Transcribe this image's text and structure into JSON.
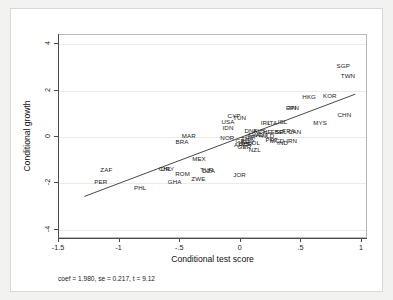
{
  "chart_data": {
    "type": "scatter",
    "title": "",
    "xlabel": "Conditional test score",
    "ylabel": "Conditional growth",
    "xlim": [
      -1.5,
      1.05
    ],
    "ylim": [
      -4.4,
      4.4
    ],
    "xticks": [
      -1.5,
      -1,
      -0.5,
      0,
      0.5,
      1
    ],
    "xticklabels": [
      "-1.5",
      "-1",
      "-.5",
      "0",
      ".5",
      "1"
    ],
    "yticks": [
      4,
      2,
      0,
      -2,
      -4
    ],
    "yticklabels": [
      "4",
      "2",
      "0",
      "-2",
      "-4"
    ],
    "grid": "horizontal",
    "marker_style": "text-label",
    "legend": "none",
    "annotation": "coef = 1.980, se = 0.217, t = 9.12",
    "fit_line": {
      "type": "linear",
      "slope": 1.98,
      "intercept": -0.08,
      "x_start": -1.29,
      "x_end": 0.96,
      "color": "#333333"
    },
    "points": [
      {
        "label": "SGP",
        "x": 0.845,
        "y": 3.06
      },
      {
        "label": "TWN",
        "x": 0.885,
        "y": 2.62
      },
      {
        "label": "HKG",
        "x": 0.565,
        "y": 1.74
      },
      {
        "label": "KOR",
        "x": 0.735,
        "y": 1.76
      },
      {
        "label": "CHN",
        "x": 0.855,
        "y": 0.93
      },
      {
        "label": "MYS",
        "x": 0.655,
        "y": 0.6
      },
      {
        "label": "FIN",
        "x": 0.415,
        "y": 1.26
      },
      {
        "label": "JPN",
        "x": 0.432,
        "y": 1.26
      },
      {
        "label": "ISL",
        "x": 0.345,
        "y": 0.63
      },
      {
        "label": "IRL",
        "x": 0.205,
        "y": 0.62
      },
      {
        "label": "ITA",
        "x": 0.262,
        "y": 0.61
      },
      {
        "label": "CYP",
        "x": -0.055,
        "y": 0.92
      },
      {
        "label": "TUN",
        "x": -0.01,
        "y": 0.82
      },
      {
        "label": "USA",
        "x": -0.105,
        "y": 0.64
      },
      {
        "label": "IDN",
        "x": -0.105,
        "y": 0.37
      },
      {
        "label": "NOR",
        "x": -0.11,
        "y": -0.04
      },
      {
        "label": "MAR",
        "x": -0.43,
        "y": 0.05
      },
      {
        "label": "BRA",
        "x": -0.485,
        "y": -0.2
      },
      {
        "label": "FRA",
        "x": 0.395,
        "y": 0.24
      },
      {
        "label": "CAN",
        "x": 0.445,
        "y": 0.22
      },
      {
        "label": "BEL",
        "x": 0.33,
        "y": 0.23
      },
      {
        "label": "ESP",
        "x": 0.3,
        "y": 0.23
      },
      {
        "label": "DNK",
        "x": 0.085,
        "y": 0.26
      },
      {
        "label": "AUS",
        "x": 0.155,
        "y": 0.25
      },
      {
        "label": "CHE",
        "x": 0.2,
        "y": 0.23
      },
      {
        "label": "SWE",
        "x": 0.12,
        "y": 0.1
      },
      {
        "label": "AUT",
        "x": 0.175,
        "y": 0.08
      },
      {
        "label": "NLD",
        "x": 0.225,
        "y": 0.06
      },
      {
        "label": "ISR",
        "x": 0.08,
        "y": 0.02
      },
      {
        "label": "PRT",
        "x": 0.255,
        "y": -0.12
      },
      {
        "label": "MCD",
        "x": 0.3,
        "y": -0.15
      },
      {
        "label": "IND",
        "x": 0.345,
        "y": -0.24
      },
      {
        "label": "IRN",
        "x": 0.42,
        "y": -0.18
      },
      {
        "label": "THA",
        "x": 0.055,
        "y": -0.1
      },
      {
        "label": "GRC",
        "x": 0.015,
        "y": -0.18
      },
      {
        "label": "EGY",
        "x": 0.06,
        "y": -0.22
      },
      {
        "label": "COL",
        "x": 0.105,
        "y": -0.26
      },
      {
        "label": "GBR",
        "x": 0.04,
        "y": -0.3
      },
      {
        "label": "ARG",
        "x": 0.0,
        "y": -0.33
      },
      {
        "label": "GER",
        "x": 0.03,
        "y": -0.44
      },
      {
        "label": "NZL",
        "x": 0.115,
        "y": -0.55
      },
      {
        "label": "MEX",
        "x": -0.345,
        "y": -0.96
      },
      {
        "label": "ZAF",
        "x": -1.11,
        "y": -1.42
      },
      {
        "label": "PER",
        "x": -1.155,
        "y": -1.94
      },
      {
        "label": "PHL",
        "x": -0.83,
        "y": -2.18
      },
      {
        "label": "GHA",
        "x": -0.545,
        "y": -1.94
      },
      {
        "label": "ROM",
        "x": -0.48,
        "y": -1.6
      },
      {
        "label": "ZWE",
        "x": -0.35,
        "y": -1.8
      },
      {
        "label": "TUR",
        "x": -0.28,
        "y": -1.44
      },
      {
        "label": "DZA",
        "x": -0.265,
        "y": -1.46
      },
      {
        "label": "CHL",
        "x": -0.625,
        "y": -1.38
      },
      {
        "label": "URY",
        "x": -0.605,
        "y": -1.38
      },
      {
        "label": "JOR",
        "x": -0.01,
        "y": -1.62
      }
    ]
  }
}
